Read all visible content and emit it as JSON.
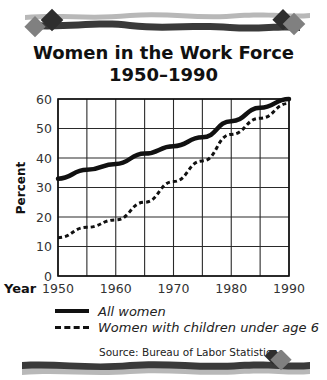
{
  "chart_data": {
    "type": "line",
    "title": "Women in the Work Force",
    "subtitle": "1950–1990",
    "xlabel": "Year",
    "ylabel": "Percent",
    "x": [
      1950,
      1955,
      1960,
      1965,
      1970,
      1975,
      1980,
      1985,
      1990
    ],
    "xticks": [
      "1950",
      "1960",
      "1970",
      "1980",
      "1990"
    ],
    "yticks": [
      "0",
      "10",
      "20",
      "30",
      "40",
      "50",
      "60"
    ],
    "xlim": [
      1950,
      1990
    ],
    "ylim": [
      0,
      60
    ],
    "grid": true,
    "legend_position": "bottom",
    "series": [
      {
        "name": "All women",
        "style": "solid",
        "values": [
          33,
          36,
          38,
          41.5,
          44,
          47,
          52.5,
          57,
          60
        ]
      },
      {
        "name": "Women with children under age 6",
        "style": "dashed",
        "values": [
          13,
          16.5,
          19,
          25,
          32,
          39,
          48,
          53.5,
          58.5
        ]
      }
    ],
    "source": "Source: Bureau of Labor Statistics"
  },
  "header": {
    "title_line1": "Women in the Work Force",
    "title_line2": "1950–1990"
  },
  "axes": {
    "y_label": "Percent",
    "x_label": "Year"
  },
  "legend": {
    "items": [
      {
        "label": "All women"
      },
      {
        "label": "Women with children under age 6"
      }
    ]
  },
  "footer": {
    "source": "Source: Bureau of Labor Statistics"
  },
  "colors": {
    "line": "#111111",
    "grid": "#333333",
    "banner_dark": "#3a3a3a",
    "banner_light": "#b8b8b8",
    "diamond_mid": "#777777"
  }
}
